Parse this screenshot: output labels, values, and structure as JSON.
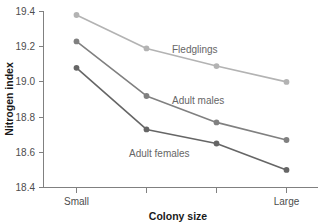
{
  "chart_data": {
    "type": "line",
    "title": "",
    "xlabel": "Colony size",
    "ylabel": "Nitrogen index",
    "categories": [
      "Small",
      "",
      "",
      "Large"
    ],
    "xtick_labels": [
      "Small",
      "",
      "",
      "Large"
    ],
    "ytick_labels": [
      "19.4",
      "19.2",
      "19.0",
      "18.8",
      "18.6",
      "18.4"
    ],
    "ytick_values": [
      19.4,
      19.2,
      19.0,
      18.8,
      18.6,
      18.4
    ],
    "ylim": [
      18.4,
      19.4
    ],
    "grid": false,
    "legend": "inline-annotations",
    "series": [
      {
        "name": "Fledglings",
        "label": "Fledglings",
        "color": "#b3b3b3",
        "marker": "circle",
        "values": [
          19.38,
          19.19,
          19.09,
          19.0
        ]
      },
      {
        "name": "Adult males",
        "label": "Adult males",
        "color": "#808080",
        "marker": "circle",
        "values": [
          19.23,
          18.92,
          18.77,
          18.67
        ]
      },
      {
        "name": "Adult females",
        "label": "Adult females",
        "color": "#666666",
        "marker": "circle",
        "values": [
          19.08,
          18.73,
          18.65,
          18.5
        ]
      }
    ],
    "annotations": [
      {
        "text": "Fledglings",
        "x": 19.0,
        "y": 19.18
      },
      {
        "text": "Adult males",
        "x": 19.0,
        "y": 18.94
      },
      {
        "text": "Adult females",
        "x": 19.0,
        "y": 18.62
      }
    ]
  },
  "axis": {
    "y_title": "Nitrogen index",
    "x_title": "Colony size",
    "y_ticks": [
      "19.4",
      "19.2",
      "19.0",
      "18.8",
      "18.6",
      "18.4"
    ],
    "x_ticks": [
      "Small",
      "Large"
    ]
  },
  "colors": {
    "fledglings": "#b3b3b3",
    "adult_males": "#808080",
    "adult_females": "#666666",
    "axis": "#808080",
    "text": "#4d4d4d",
    "title_text": "#1a1a1a",
    "background": "#ffffff"
  }
}
